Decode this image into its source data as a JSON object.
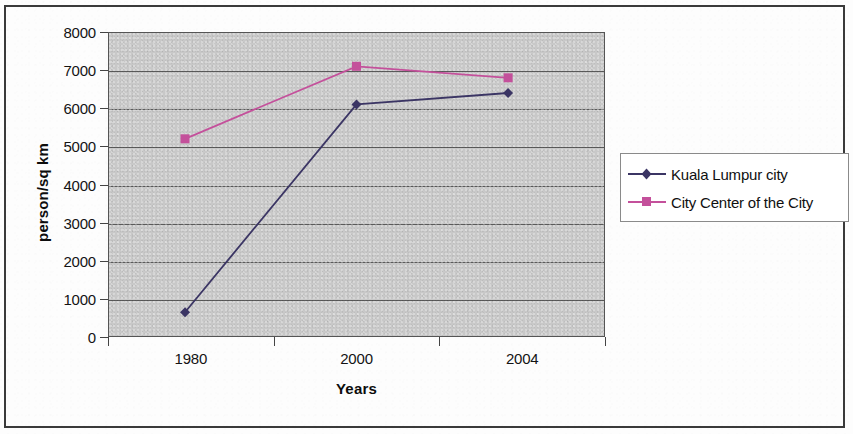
{
  "figure": {
    "border_color": "#3a3a3a",
    "plot_background": "#c8c8c8"
  },
  "chart_data": {
    "type": "line",
    "title": "",
    "subtitle": "",
    "xlabel": "Years",
    "ylabel": "person/sq km",
    "categories": [
      "1980",
      "2000",
      "2004"
    ],
    "x_tick_labels": [
      "1980",
      "2000",
      "2004"
    ],
    "y_tick_labels": [
      "8000",
      "7000",
      "6000",
      "5000",
      "4000",
      "3000",
      "2000",
      "1000",
      "0"
    ],
    "ylim": [
      0,
      8000
    ],
    "y_tick_step": 1000,
    "grid": "horizontal",
    "legend_position": "right",
    "series": [
      {
        "name": "Kuala Lumpur city",
        "color": "#3b3564",
        "marker": "diamond",
        "values": [
          650,
          6100,
          6400
        ]
      },
      {
        "name": "City Center of the City",
        "color": "#c4509b",
        "marker": "square",
        "values": [
          5200,
          7100,
          6800
        ]
      }
    ]
  },
  "legend": {
    "items": [
      {
        "label": "Kuala Lumpur city",
        "color": "#3b3564",
        "marker": "diamond"
      },
      {
        "label": "City Center of the City",
        "color": "#c4509b",
        "marker": "square"
      }
    ]
  }
}
